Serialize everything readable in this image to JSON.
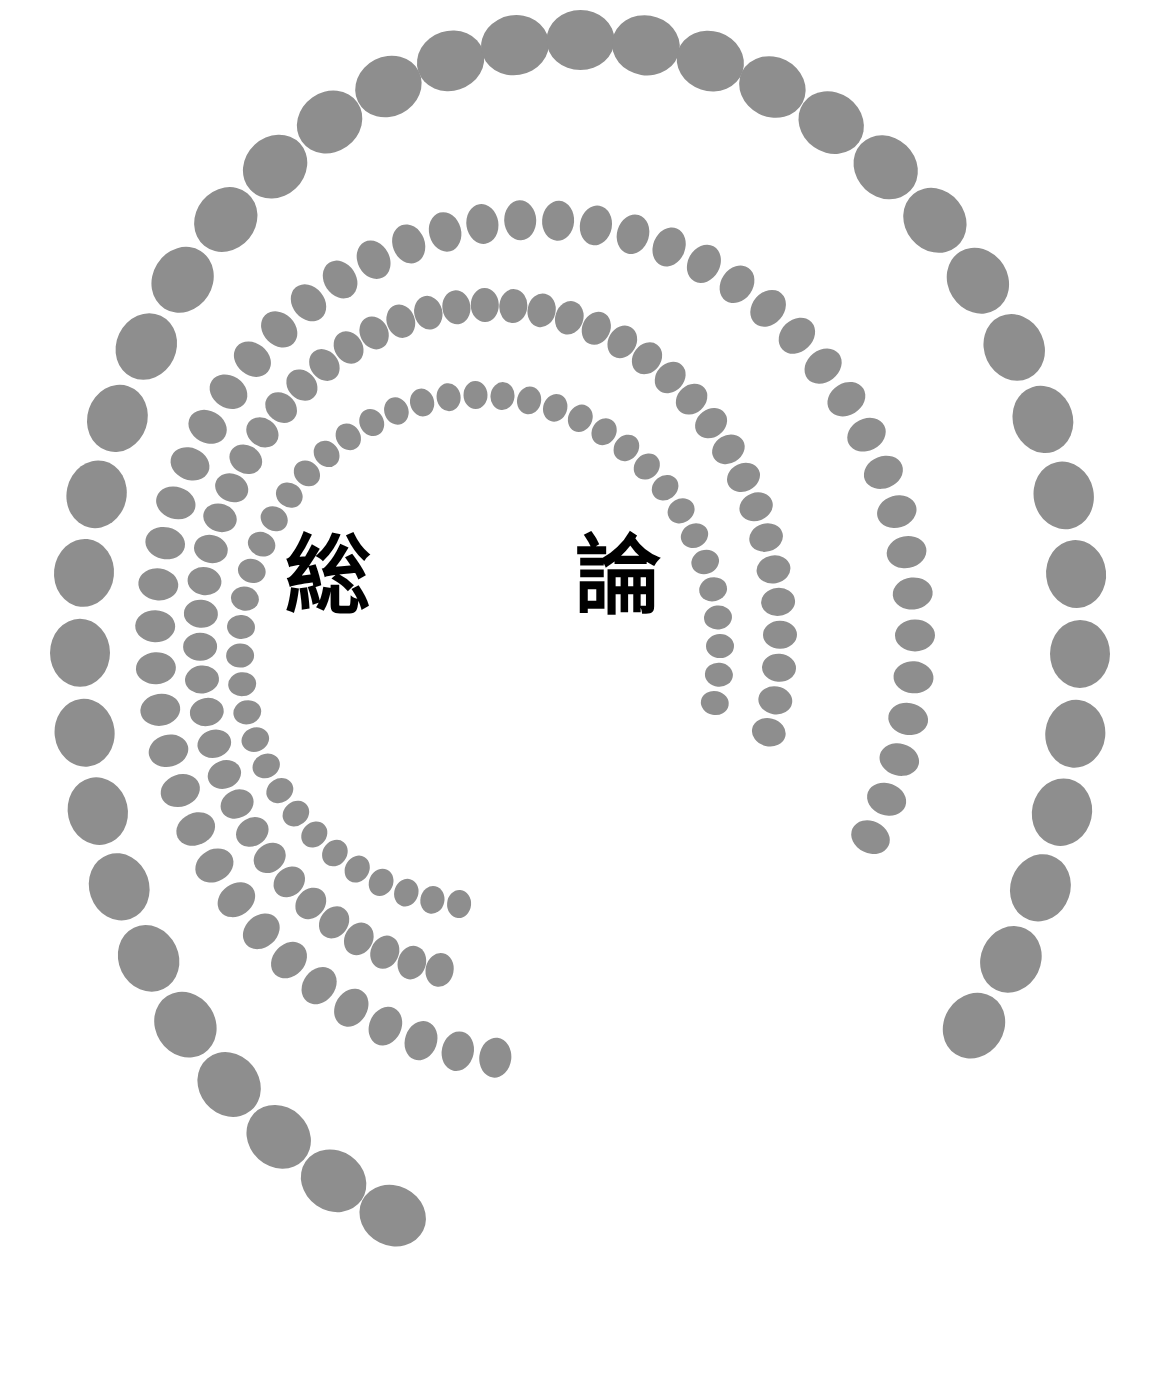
{
  "title": {
    "char1": "総",
    "char2": "論"
  },
  "colors": {
    "dot": "#8e8e8e",
    "background": "#ffffff",
    "title": "#000000"
  },
  "arcs": [
    {
      "name": "outer-arc",
      "cx": 580,
      "cy": 650,
      "rx": 500,
      "ry": 610,
      "start_deg": 112,
      "end_deg": 398,
      "count": 39,
      "dot_rx": 30,
      "dot_ry": 34
    },
    {
      "name": "arc-2",
      "cx": 535,
      "cy": 640,
      "rx": 380,
      "ry": 420,
      "start_deg": 96,
      "end_deg": 388,
      "count": 52,
      "dot_rx": 20,
      "dot_ry": 16
    },
    {
      "name": "arc-3",
      "cx": 490,
      "cy": 640,
      "rx": 290,
      "ry": 335,
      "start_deg": 100,
      "end_deg": 376,
      "count": 50,
      "dot_rx": 17,
      "dot_ry": 14
    },
    {
      "name": "inner-arc",
      "cx": 480,
      "cy": 650,
      "rx": 240,
      "ry": 255,
      "start_deg": 95,
      "end_deg": 372,
      "count": 44,
      "dot_rx": 14,
      "dot_ry": 12
    }
  ]
}
